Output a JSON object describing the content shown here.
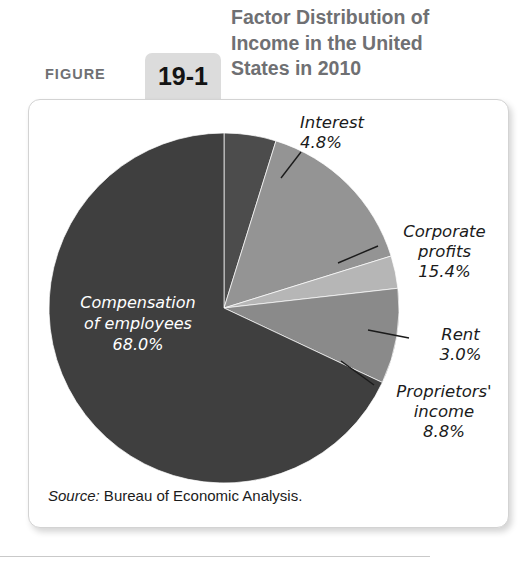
{
  "header": {
    "figure_word": "FIGURE",
    "figure_number": "19-1",
    "title": "Factor Distribution of\nIncome in the United\nStates in 2010"
  },
  "card": {
    "source_label": "Source:",
    "source_text": " Bureau of Economic Analysis."
  },
  "labels": {
    "interest": "Interest\n4.8%",
    "corporate_profits": "Corporate\nprofits\n15.4%",
    "rent": "Rent\n3.0%",
    "proprietors_income": "Proprietors'\nincome\n8.8%",
    "compensation": "Compensation\nof employees\n68.0%"
  },
  "colors": {
    "compensation": "#3f3f3f",
    "interest": "#4c4c4c",
    "corporate_profits": "#949494",
    "rent": "#b6b6b6",
    "proprietors_income": "#8a8a8a",
    "tab_bg": "#dcdcdc",
    "title_gray": "#6f7073",
    "card_border": "#d3d3d3"
  },
  "chart_data": {
    "type": "pie",
    "title": "Factor Distribution of Income in the United States in 2010",
    "source": "Source: Bureau of Economic Analysis.",
    "units": "percent of total income",
    "start_angle_deg": 0,
    "direction": "clockwise",
    "center": [
      224,
      308
    ],
    "radius": 175,
    "categories": [
      "Interest",
      "Corporate profits",
      "Rent",
      "Proprietors' income",
      "Compensation of employees"
    ],
    "values": [
      4.8,
      15.4,
      3.0,
      8.8,
      68.0
    ],
    "slices": [
      {
        "name": "Interest",
        "value": 4.8,
        "label": "4.8%",
        "color": "#4c4c4c",
        "label_position": "outside-top-right"
      },
      {
        "name": "Corporate profits",
        "value": 15.4,
        "label": "15.4%",
        "color": "#949494",
        "label_position": "outside-right"
      },
      {
        "name": "Rent",
        "value": 3.0,
        "label": "3.0%",
        "color": "#b6b6b6",
        "label_position": "outside-right"
      },
      {
        "name": "Proprietors' income",
        "value": 8.8,
        "label": "8.8%",
        "color": "#8a8a8a",
        "label_position": "outside-bottom-right"
      },
      {
        "name": "Compensation of employees",
        "value": 68.0,
        "label": "68.0%",
        "color": "#3f3f3f",
        "label_position": "inside"
      }
    ],
    "legend": "none",
    "grid": false
  }
}
